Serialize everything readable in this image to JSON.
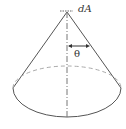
{
  "diagram": {
    "labels": {
      "area_element": "dA",
      "half_angle": "θ"
    },
    "colors": {
      "stroke": "#555555",
      "dashed": "#aaaaaa",
      "background": "#ffffff"
    }
  }
}
